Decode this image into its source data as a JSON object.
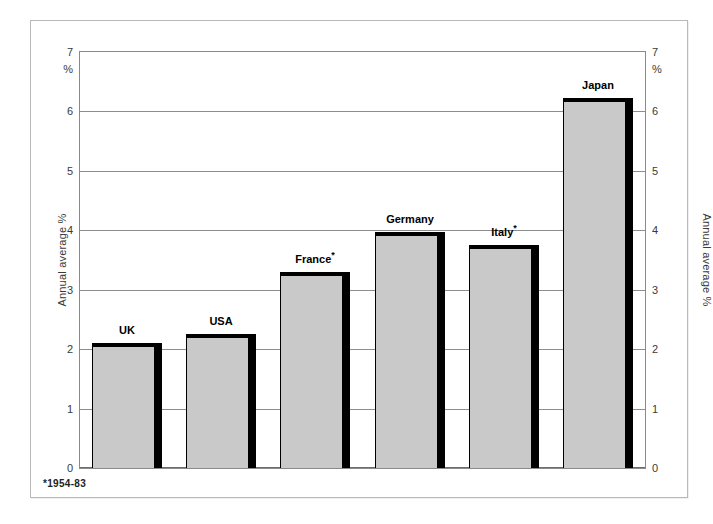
{
  "footnote": "*1954-83",
  "axis": {
    "left_title": "Annual average %",
    "right_title": "Annual average %",
    "unit": "%",
    "ticks": [
      "7",
      "6",
      "5",
      "4",
      "3",
      "2",
      "1",
      "0"
    ]
  },
  "colors": {
    "bar_fill": "#c9c9c9",
    "bar_edge": "#000000",
    "gridline": "#8d8d8d",
    "frame": "#8a8a8a",
    "card_border": "#b9b9b9",
    "text": "#000000"
  },
  "chart_data": {
    "type": "bar",
    "title": "",
    "subtitle": "",
    "xlabel": "",
    "ylabel": "Annual average %",
    "ylim": [
      0,
      7
    ],
    "yticks": [
      0,
      1,
      2,
      3,
      4,
      5,
      6,
      7
    ],
    "grid": true,
    "legend": "none",
    "unit": "%",
    "annotations": [
      "*1954-83"
    ],
    "categories": [
      "UK",
      "USA",
      "France*",
      "Germany",
      "Italy*",
      "Japan"
    ],
    "values": [
      2.1,
      2.25,
      3.3,
      3.97,
      3.75,
      6.22
    ],
    "bars": [
      {
        "label": "UK",
        "label_html": "UK",
        "value": 2.1
      },
      {
        "label": "USA",
        "label_html": "USA",
        "value": 2.25
      },
      {
        "label": "France*",
        "label_html": "France<sup>*</sup>",
        "value": 3.3
      },
      {
        "label": "Germany",
        "label_html": "Germany",
        "value": 3.97
      },
      {
        "label": "Italy*",
        "label_html": "Italy<sup>*</sup>",
        "value": 3.75
      },
      {
        "label": "Japan",
        "label_html": "Japan",
        "value": 6.22
      }
    ]
  }
}
